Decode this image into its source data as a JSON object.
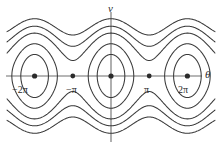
{
  "figure": {
    "kind": "phase-portrait",
    "caption": "",
    "axis_labels": {
      "x": "θ",
      "y": "v"
    },
    "colors": {
      "background": "#ffffff",
      "axis": "#6e6e6e",
      "trajectory": "#3a3a3a",
      "fixed_point": "#2b2b2b",
      "text": "#2b2b2b"
    }
  },
  "ticks": {
    "x": [
      {
        "label": "−2π",
        "value": -6.283185
      },
      {
        "label": "−π",
        "value": -3.141593
      },
      {
        "label": "π",
        "value": 3.141593
      },
      {
        "label": "2π",
        "value": 6.283185
      }
    ]
  },
  "chart_data": {
    "type": "line",
    "title": "",
    "xlabel": "θ",
    "ylabel": "v",
    "xlim": [
      -8.55,
      8.55
    ],
    "ylim": [
      -3.6,
      3.6
    ],
    "grid": false,
    "legend": null,
    "equation": "v^2/2 - cos(theta) = E",
    "fixed_points": [
      {
        "theta": -6.283185,
        "v": 0,
        "type": "center",
        "label": "−2π"
      },
      {
        "theta": -3.141593,
        "v": 0,
        "type": "saddle",
        "label": "−π"
      },
      {
        "theta": 0,
        "v": 0,
        "type": "center",
        "label": "0"
      },
      {
        "theta": 3.141593,
        "v": 0,
        "type": "saddle",
        "label": "π"
      },
      {
        "theta": 6.283185,
        "v": 0,
        "type": "center",
        "label": "2π"
      }
    ],
    "separatrix_energy": 1.0,
    "series": [
      {
        "name": "libration-inner",
        "energy": -0.42,
        "kind": "closed-orbit"
      },
      {
        "name": "libration-outer",
        "energy": 0.3,
        "kind": "closed-orbit"
      },
      {
        "name": "separatrix",
        "energy": 1.0,
        "kind": "separatrix"
      },
      {
        "name": "rotation-1-upper",
        "energy": 1.3,
        "kind": "rotating"
      },
      {
        "name": "rotation-2-upper",
        "energy": 2.1,
        "kind": "rotating"
      },
      {
        "name": "rotation-3-upper",
        "energy": 3.1,
        "kind": "rotating"
      },
      {
        "name": "rotation-1-lower",
        "energy": 1.3,
        "kind": "rotating"
      },
      {
        "name": "rotation-2-lower",
        "energy": 2.1,
        "kind": "rotating"
      },
      {
        "name": "rotation-3-lower",
        "energy": 3.1,
        "kind": "rotating"
      }
    ]
  }
}
